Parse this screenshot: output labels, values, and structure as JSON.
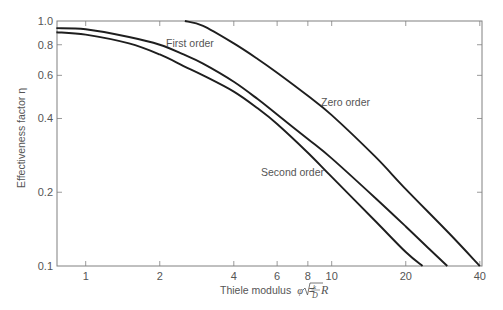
{
  "chart_data": {
    "type": "line",
    "title": "",
    "xlabel": "Thiele modulus φ = R√(k/D)",
    "xlabel_parts": {
      "text": "Thiele modulus",
      "symbol": "φ",
      "equals": "=",
      "R": "R",
      "frac_num": "k",
      "frac_den": "D"
    },
    "ylabel": "Effectiveness factor η",
    "xscale": "log",
    "yscale": "log",
    "xlim": [
      0.76,
      40
    ],
    "ylim": [
      0.1,
      1.0
    ],
    "grid": false,
    "legend": "none (inline curve labels)",
    "x_ticks": [
      1,
      2,
      4,
      6,
      8,
      10,
      20,
      40
    ],
    "x_tick_labels": [
      "1",
      "2",
      "4",
      "6",
      "8",
      "10",
      "20",
      "40"
    ],
    "y_ticks": [
      0.1,
      0.2,
      0.4,
      0.6,
      0.8,
      1.0
    ],
    "y_tick_labels": [
      "0.1",
      "0.2",
      "0.4",
      "0.6",
      "0.8",
      "1.0"
    ],
    "series": [
      {
        "name": "First order",
        "label": "First order",
        "label_pos": {
          "x": 166,
          "y": 47
        },
        "x": [
          0.76,
          1.0,
          1.5,
          2.0,
          2.5,
          3.0,
          4.0,
          5.0,
          6.0,
          8.0,
          10.0,
          15.0,
          20.0,
          25.0,
          29.5
        ],
        "y": [
          0.935,
          0.925,
          0.86,
          0.8,
          0.73,
          0.67,
          0.565,
          0.48,
          0.415,
          0.33,
          0.275,
          0.19,
          0.145,
          0.117,
          0.1
        ]
      },
      {
        "name": "Second order",
        "label": "Second order",
        "label_pos": {
          "x": 261,
          "y": 176
        },
        "x": [
          0.76,
          1.0,
          1.5,
          2.0,
          2.5,
          3.0,
          4.0,
          5.0,
          6.0,
          8.0,
          10.0,
          15.0,
          20.0,
          23.4
        ],
        "y": [
          0.9,
          0.88,
          0.81,
          0.73,
          0.655,
          0.6,
          0.515,
          0.44,
          0.38,
          0.29,
          0.231,
          0.153,
          0.114,
          0.1
        ]
      },
      {
        "name": "Zero order",
        "label": "Zero order",
        "label_pos": {
          "x": 321,
          "y": 106
        },
        "x": [
          2.53,
          3.0,
          4.0,
          5.0,
          6.0,
          8.0,
          10.0,
          15.0,
          20.0,
          30.0,
          40.0
        ],
        "y": [
          1.0,
          0.955,
          0.81,
          0.7,
          0.615,
          0.495,
          0.413,
          0.28,
          0.206,
          0.136,
          0.1
        ]
      }
    ]
  },
  "colors": {
    "axis": "#808080",
    "curve": "#1e1e1e",
    "text": "#555555",
    "background": "#ffffff"
  }
}
